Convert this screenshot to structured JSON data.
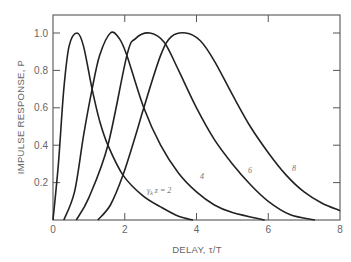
{
  "chart_data": {
    "type": "line",
    "title": "",
    "xlabel": "DELAY, τ/T",
    "ylabel": "IMPULSE RESPONSE, P",
    "xlim": [
      0,
      8
    ],
    "ylim": [
      0,
      1.1
    ],
    "xticks": [
      0,
      2,
      4,
      6,
      8
    ],
    "yticks": [
      0.2,
      0.4,
      0.6,
      0.8,
      1.0
    ],
    "xtick_labels": [
      "0",
      "2",
      "4",
      "6",
      "8"
    ],
    "ytick_labels": [
      "0.2",
      "0.4",
      "0.6",
      "0.8",
      "1.0"
    ],
    "origin_label": "0",
    "grid": false,
    "legend": "inline curve labels",
    "series": [
      {
        "name": "γₖz = 2",
        "label": "γ",
        "label_sub": "k",
        "label_rest": "z = 2",
        "points": [
          [
            0,
            0
          ],
          [
            0.15,
            0.3
          ],
          [
            0.3,
            0.7
          ],
          [
            0.45,
            0.93
          ],
          [
            0.67,
            1.0
          ],
          [
            0.85,
            0.93
          ],
          [
            1.09,
            0.7
          ],
          [
            1.3,
            0.53
          ],
          [
            1.53,
            0.4
          ],
          [
            1.95,
            0.24
          ],
          [
            2.5,
            0.13
          ],
          [
            3.0,
            0.07
          ],
          [
            3.5,
            0.02
          ],
          [
            3.9,
            0
          ]
        ]
      },
      {
        "name": "4",
        "label": "4",
        "points": [
          [
            0.3,
            0
          ],
          [
            0.6,
            0.15
          ],
          [
            0.85,
            0.45
          ],
          [
            1.09,
            0.7
          ],
          [
            1.3,
            0.88
          ],
          [
            1.6,
            1.0
          ],
          [
            1.85,
            0.97
          ],
          [
            2.06,
            0.88
          ],
          [
            2.53,
            0.6
          ],
          [
            3.0,
            0.4
          ],
          [
            3.5,
            0.25
          ],
          [
            4.0,
            0.15
          ],
          [
            4.5,
            0.08
          ],
          [
            5.0,
            0.04
          ],
          [
            5.9,
            0
          ]
        ]
      },
      {
        "name": "6",
        "label": "6",
        "points": [
          [
            0.65,
            0
          ],
          [
            1.0,
            0.12
          ],
          [
            1.53,
            0.4
          ],
          [
            2.06,
            0.88
          ],
          [
            2.3,
            0.97
          ],
          [
            2.7,
            1.0
          ],
          [
            3.1,
            0.95
          ],
          [
            3.5,
            0.8
          ],
          [
            4.0,
            0.6
          ],
          [
            4.5,
            0.43
          ],
          [
            5.0,
            0.3
          ],
          [
            5.5,
            0.19
          ],
          [
            6.0,
            0.1
          ],
          [
            6.6,
            0.03
          ],
          [
            7.3,
            0
          ]
        ]
      },
      {
        "name": "8",
        "label": "8",
        "points": [
          [
            1.25,
            0
          ],
          [
            1.6,
            0.08
          ],
          [
            1.95,
            0.24
          ],
          [
            2.3,
            0.45
          ],
          [
            2.53,
            0.6
          ],
          [
            3.0,
            0.88
          ],
          [
            3.3,
            0.98
          ],
          [
            3.7,
            1.0
          ],
          [
            4.1,
            0.96
          ],
          [
            4.5,
            0.85
          ],
          [
            5.0,
            0.67
          ],
          [
            5.5,
            0.5
          ],
          [
            6.0,
            0.36
          ],
          [
            6.5,
            0.24
          ],
          [
            7.0,
            0.15
          ],
          [
            7.5,
            0.09
          ],
          [
            8.0,
            0.05
          ]
        ]
      }
    ],
    "label_positions": [
      [
        147,
        193
      ],
      [
        200,
        179
      ],
      [
        248,
        173
      ],
      [
        292,
        171
      ]
    ]
  }
}
